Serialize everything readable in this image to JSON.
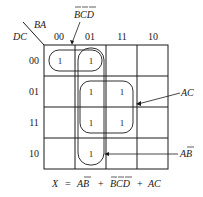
{
  "kmap": {
    "corner": {
      "row_var": "DC",
      "col_var": "BA"
    },
    "col_headers": [
      "00",
      "01",
      "11",
      "10"
    ],
    "row_headers": [
      "00",
      "01",
      "11",
      "10"
    ],
    "cells": [
      [
        "1",
        "1",
        "",
        ""
      ],
      [
        "",
        "1",
        "1",
        ""
      ],
      [
        "",
        "1",
        "1",
        ""
      ],
      [
        "",
        "1",
        "",
        ""
      ]
    ],
    "groups": [
      {
        "label": "B̄C̄D̄",
        "label_main": "BCD",
        "cells": "row 00, cols 00-01"
      },
      {
        "label": "AC",
        "label_main": "AC",
        "cells": "rows 01-11, cols 01-11"
      },
      {
        "label": "AB̄",
        "label_main": "AB",
        "cells": "rows 00-10, col 01"
      }
    ]
  },
  "equation": {
    "lhs": "X",
    "eq": "=",
    "term1": "AB̄",
    "plus1": "+",
    "term2": "B̄C̄D̄",
    "plus2": "+",
    "term3": "AC"
  },
  "colors": {
    "line": "#1a1a1a",
    "background": "#ffffff"
  }
}
